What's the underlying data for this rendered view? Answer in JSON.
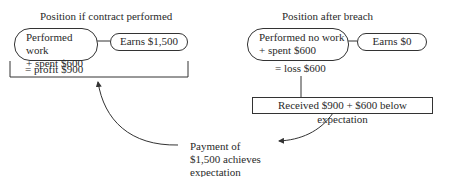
{
  "left": {
    "title": "Position if contract performed",
    "box_line1": "Performed work",
    "box_line2": "+ spent $600",
    "earns": "Earns $1,500",
    "result": "= profit $900"
  },
  "right": {
    "title": "Position after breach",
    "box_line1": "Performed no work",
    "box_line2": "+ spent $600",
    "earns": "Earns $0",
    "result": "= loss $600",
    "received": "Received $900 + $600 below expectation"
  },
  "payment": {
    "line1": "Payment of",
    "line2": "$1,500 achieves",
    "line3": "expectation"
  }
}
